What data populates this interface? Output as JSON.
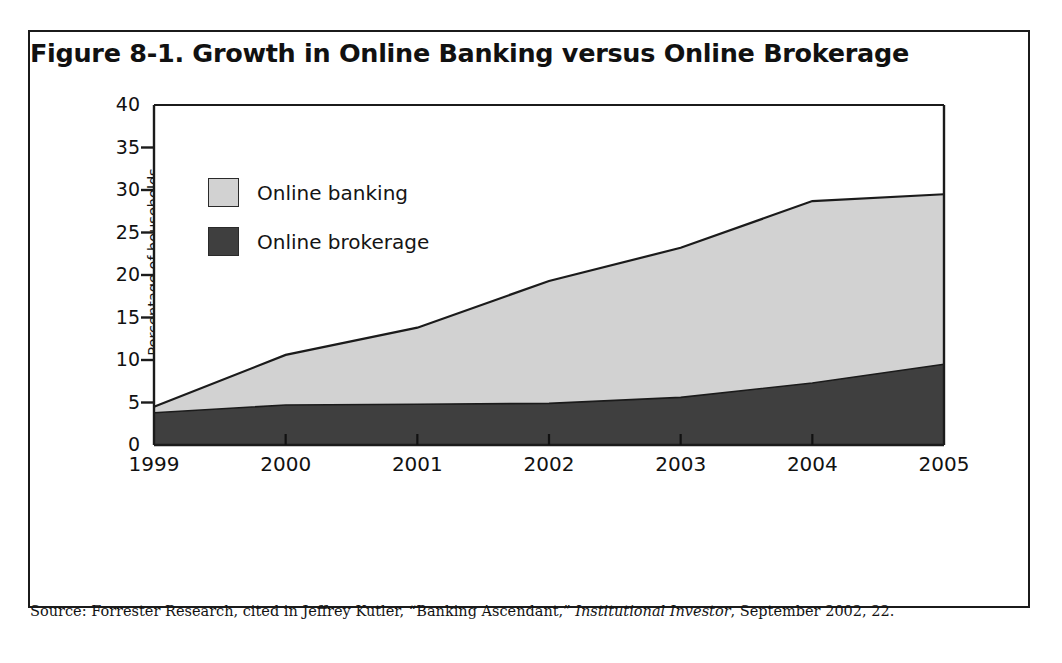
{
  "figure": {
    "title": "Figure 8-1. Growth in Online Banking versus Online Brokerage",
    "source_prefix": "Source: Forrester Research, cited in Jeffrey Kutler, “Banking Ascendant,” ",
    "source_italic": "Institutional Investor",
    "source_suffix": ", September 2002, 22."
  },
  "colors": {
    "online_banking": "#d2d2d2",
    "online_brokerage": "#3f3f3f",
    "axis": "#1b1b1b",
    "frame": "#1b1b1b",
    "text": "#111111",
    "background": "#ffffff"
  },
  "legend": {
    "position": "inside-top-left",
    "items": [
      {
        "label": "Online banking",
        "color": "#d2d2d2"
      },
      {
        "label": "Online brokerage",
        "color": "#3f3f3f"
      }
    ]
  },
  "chart_data": {
    "type": "area",
    "stacked": true,
    "title": "Figure 8-1. Growth in Online Banking versus Online Brokerage",
    "xlabel": "",
    "ylabel": "Percentage of households",
    "x": [
      "1999",
      "2000",
      "2001",
      "2002",
      "2003",
      "2004",
      "2005"
    ],
    "categories": [
      "1999",
      "2000",
      "2001",
      "2002",
      "2003",
      "2004",
      "2005"
    ],
    "ylim": [
      0,
      40
    ],
    "yticks": [
      0,
      5,
      10,
      15,
      20,
      25,
      30,
      35,
      40
    ],
    "ytick_labels": [
      "0",
      "5",
      "10",
      "15",
      "20",
      "25",
      "30",
      "35",
      "40"
    ],
    "grid": false,
    "series": [
      {
        "name": "Online brokerage",
        "color": "#3f3f3f",
        "stack_order": 1,
        "values": [
          3.8,
          4.7,
          4.8,
          4.9,
          5.6,
          7.3,
          9.5
        ]
      },
      {
        "name": "Online banking",
        "color": "#d2d2d2",
        "stack_order": 2,
        "values": [
          0.7,
          5.9,
          9.0,
          14.4,
          17.6,
          21.4,
          20.0
        ]
      }
    ],
    "cumulative_totals": [
      4.5,
      10.6,
      13.8,
      19.3,
      23.2,
      28.7,
      29.5
    ]
  }
}
